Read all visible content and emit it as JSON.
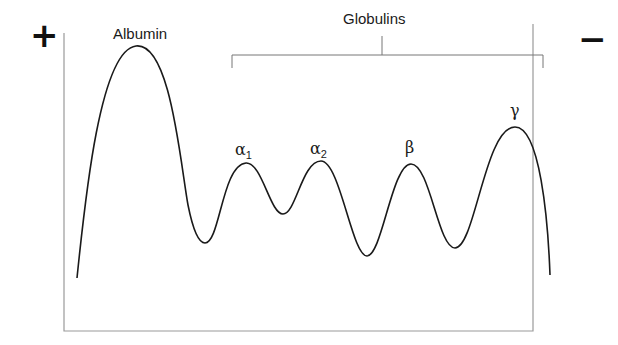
{
  "diagram": {
    "anode_symbol": "+",
    "cathode_symbol": "−",
    "group_label": "Globulins",
    "peaks": [
      {
        "key": "albumin",
        "label": "Albumin",
        "sub": ""
      },
      {
        "key": "alpha1",
        "label": "α",
        "sub": "1"
      },
      {
        "key": "alpha2",
        "label": "α",
        "sub": "2"
      },
      {
        "key": "beta",
        "label": "β",
        "sub": ""
      },
      {
        "key": "gamma",
        "label": "γ",
        "sub": ""
      }
    ],
    "colors": {
      "curve": "#1a1a1a",
      "frame": "#9a9a9a",
      "bracket": "#777777"
    }
  }
}
